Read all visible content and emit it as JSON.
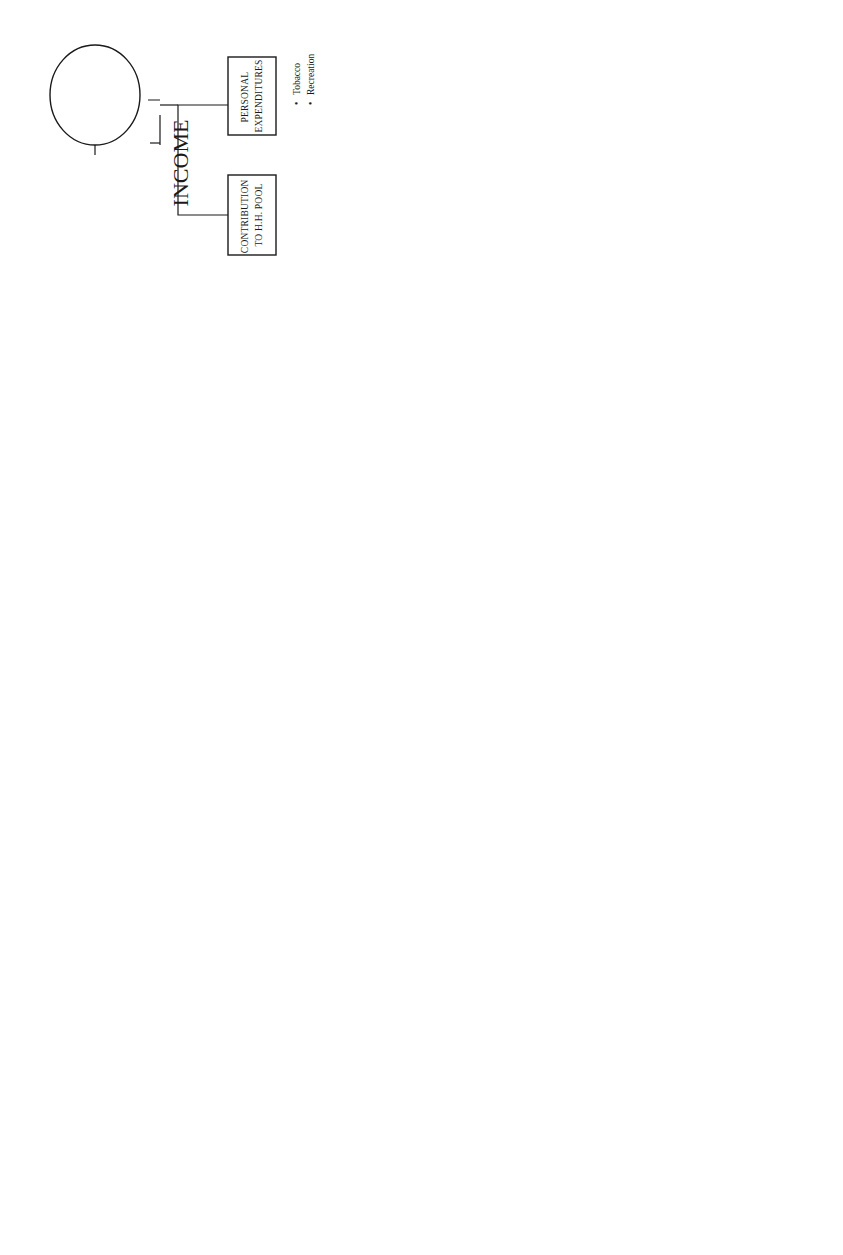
{
  "figure": {
    "caption": "FIGURE 9.2",
    "symbols": {
      "equals": "="
    },
    "actors": {
      "children": {
        "shape": "diamond",
        "label": [
          "ALL SINGLE",
          "WORKING",
          "CHILDREN WHO",
          "CONTRIBUTE"
        ],
        "income_label": "INCOME",
        "branches": [
          {
            "label": [
              "PERSONAL",
              "EXPENDITURES"
            ],
            "items": [
              "Transportation to",
              "place of work",
              "Food consumed",
              "at place of work",
              "Personal care &",
              "effects",
              "Clothing,",
              "footwear, and",
              "other wear",
              "Recreation:",
              "movies, parties,",
              "alcoholic",
              "beverages"
            ],
            "bullets": [
              0,
              2,
              4,
              6,
              9
            ]
          },
          {
            "label": [
              "GIFTS & CONTRIBUTION",
              "TO FATHER/MOTHER/",
              "OTHER SIBLINGS"
            ],
            "groups": [
              {
                "heading": "Father:",
                "items": [
                  "Alcoholic beverage",
                  "Tobacco",
                  "Food purchase",
                  "Recreation"
                ]
              },
              {
                "heading": "Other siblings:",
                "items": [
                  "Educational expenses",
                  "Recreation",
                  "Expenses of married",
                  "siblings"
                ],
                "bullets": [
                  0,
                  1,
                  2
                ]
              },
              {
                "heading": "Mother:",
                "items": [
                  "Personal care &",
                  "effects",
                  "Clothing, footwear,",
                  "and other wear"
                ],
                "bullets": [
                  0,
                  2
                ]
              }
            ]
          },
          {
            "label": [
              "CONTRIBUTION",
              "TO H.H. POOL"
            ]
          }
        ]
      },
      "father_income": {
        "shape": "triangle",
        "income_label": "INCOME",
        "branches": [
          {
            "label": [
              "PERSONAL",
              "EXPENDITURES"
            ],
            "items": [
              "Alcoholic beverages",
              "Tobacco",
              "Food purchase",
              "Recreation"
            ]
          },
          {
            "label": [
              "CONTRIBUTION",
              "TO H.H. POOL"
            ]
          }
        ]
      },
      "mother_income": {
        "shape": "circle",
        "income_label": "INCOME",
        "branches": [
          {
            "label": [
              "CONTRIBUTION",
              "TO H.H. POOL"
            ]
          },
          {
            "label": [
              "PERSONAL",
              "EXPENDITURES"
            ],
            "items": [
              "Tobacco",
              "Recreation"
            ]
          }
        ]
      }
    },
    "pool": {
      "label": "HOUSEHOLD INCOME POOL"
    },
    "mother": {
      "label": "MOTHER"
    },
    "sole_decision": {
      "label": [
        "Mother's Sole",
        "Decision"
      ],
      "items": [
        "Food",
        "Fuel / Light / Water",
        "Medical care",
        "Education of dependent children",
        "Clothing, footwear, and other",
        "wear of younger dependent",
        "children and husband"
      ],
      "bullets": [
        0,
        1,
        2,
        3,
        4
      ]
    },
    "negotiates": {
      "label": "Mother Negotiates",
      "parties": [
        {
          "shape": "triangle",
          "label": [
            "FATHER"
          ],
          "items": [
            "Alcoholic beverage",
            "Tobacco",
            "Recreation",
            "For possible capital expenditures",
            "in farming, other ent. act.",
            "H.H. repairs and maintenance",
            "Gifts and contribution to other h.h."
          ],
          "bullets": [
            0,
            1,
            2,
            3,
            5,
            6
          ]
        },
        {
          "shape": "diamond",
          "label": [
            "SINGLE",
            "WORKING",
            "CHILDREN"
          ],
          "items": [
            "H. H. appliances and",
            "furniture",
            "H. H. repairs and",
            "maintenance"
          ],
          "bullets": [
            0,
            2
          ]
        },
        {
          "shape": "diamond",
          "label": [
            "DEPENDENT",
            "So/Da"
          ],
          "items": [
            "Recreation",
            "Educational expenses"
          ],
          "bullets": [
            0,
            1
          ]
        }
      ]
    }
  }
}
